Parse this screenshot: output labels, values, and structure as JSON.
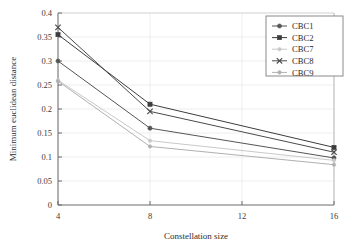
{
  "chart_data": {
    "type": "line",
    "title": "",
    "xlabel": "Constellation size",
    "ylabel": "Minimum euclidean distance",
    "x": [
      4,
      8,
      16
    ],
    "xticks": [
      "4",
      "8",
      "12",
      "16"
    ],
    "xtick_values": [
      4,
      8,
      12,
      16
    ],
    "yticks": [
      "0",
      "0.05",
      "0.1",
      "0.15",
      "0.2",
      "0.25",
      "0.3",
      "0.35",
      "0.4"
    ],
    "ytick_values": [
      0,
      0.05,
      0.1,
      0.15,
      0.2,
      0.25,
      0.3,
      0.35,
      0.4
    ],
    "xlim": [
      4,
      16
    ],
    "ylim": [
      0,
      0.4
    ],
    "grid": true,
    "legend_position": "top-right",
    "series": [
      {
        "name": "CBC1",
        "marker": "circle",
        "color": "#555555",
        "values": [
          0.3,
          0.16,
          0.098
        ]
      },
      {
        "name": "CBC2",
        "marker": "square",
        "color": "#3d3d3d",
        "values": [
          0.355,
          0.21,
          0.12
        ]
      },
      {
        "name": "CBC7",
        "marker": "dot",
        "color": "#c9c9c9",
        "values": [
          0.26,
          0.134,
          0.093
        ]
      },
      {
        "name": "CBC8",
        "marker": "x",
        "color": "#4a4a4a",
        "values": [
          0.37,
          0.195,
          0.11
        ]
      },
      {
        "name": "CBC9",
        "marker": "dot",
        "color": "#b0b0b0",
        "values": [
          0.258,
          0.122,
          0.084
        ]
      }
    ]
  },
  "legend": {
    "entries": [
      "CBC1",
      "CBC2",
      "CBC7",
      "CBC8",
      "CBC9"
    ]
  },
  "axes": {
    "x_label": "Constellation size",
    "y_label": "Minimum euclidean distance",
    "x_tick_labels": [
      "4",
      "8",
      "12",
      "16"
    ],
    "y_tick_labels": [
      "0",
      "0.05",
      "0.1",
      "0.15",
      "0.2",
      "0.25",
      "0.3",
      "0.35",
      "0.4"
    ]
  },
  "colors": {
    "axis": "#6b6b6b",
    "grid": "#eeeeee",
    "text": "#2e2e2e",
    "background": "#ffffff"
  }
}
